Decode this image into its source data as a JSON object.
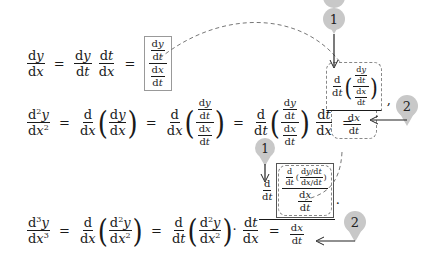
{
  "diagram": {
    "equations": [
      {
        "id": "first_derivative",
        "lhs": "dy/dx",
        "steps": [
          "dy/dt · dt/dx",
          "(dy/dt)/(dx/dt)"
        ]
      },
      {
        "id": "second_derivative",
        "lhs": "d²y/dx²",
        "steps": [
          "d/dx(dy/dx)",
          "d/dx((dy/dt)/(dx/dt))",
          "d/dt((dy/dt)/(dx/dt)) · dt/dx",
          "[d/dt((dy/dt)/(dx/dt))] / (dx/dt)"
        ]
      },
      {
        "id": "third_derivative",
        "lhs": "d³y/dx³",
        "steps": [
          "d/dx(d²y/dx²)",
          "d/dt(d²y/dx²) · dt/dx",
          "d/dt[ (d/dt((dy/dt)/(dx/dt)))/(dx/dt) ] / (dx/dt)"
        ]
      }
    ],
    "symbols": {
      "d": "d",
      "y": "y",
      "x": "x",
      "t": "t",
      "eq": "=",
      "dot": "·",
      "comma": ","
    },
    "pins": [
      {
        "label": "1",
        "color": "#c8c8c8",
        "meaning": "differentiate with respect to t"
      },
      {
        "label": "2",
        "color": "#c8c8c8",
        "meaning": "divide by dx/dt"
      },
      {
        "label": "1",
        "color": "#c8c8c8"
      },
      {
        "label": "2",
        "color": "#c8c8c8"
      }
    ],
    "colors": {
      "text": "#1a1a1a",
      "dashed": "#777777",
      "pin": "#c8c8c8",
      "box": "#999999"
    }
  }
}
